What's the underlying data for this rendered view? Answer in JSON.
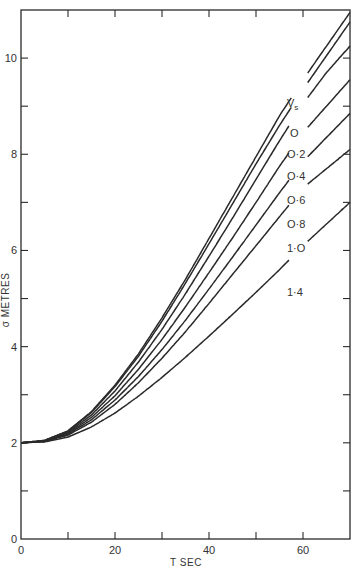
{
  "chart_data": {
    "type": "line",
    "title": "",
    "xlabel": "T SEC",
    "ylabel": "σ METRES",
    "xlim": [
      0,
      70
    ],
    "ylim": [
      0,
      11
    ],
    "x_ticks": [
      0,
      10,
      20,
      30,
      40,
      50,
      60
    ],
    "x_tick_labels": [
      "0",
      "20",
      "40",
      "60"
    ],
    "x_tick_label_values": [
      0,
      20,
      40,
      60
    ],
    "y_ticks": [
      0,
      1,
      2,
      3,
      4,
      5,
      6,
      7,
      8,
      9,
      10
    ],
    "y_tick_labels": [
      "0",
      "2",
      "4",
      "6",
      "8",
      "10"
    ],
    "y_tick_label_values": [
      0,
      2,
      4,
      6,
      8,
      10
    ],
    "grid": false,
    "legend_title": "Vs",
    "legend_position": "inline-right",
    "x": [
      0,
      5,
      10,
      15,
      20,
      25,
      30,
      35,
      40,
      45,
      50,
      55,
      60,
      65,
      70
    ],
    "series": [
      {
        "name": "0",
        "label": "O",
        "values": [
          2.0,
          2.05,
          2.25,
          2.65,
          3.2,
          3.85,
          4.6,
          5.4,
          6.25,
          7.1,
          7.95,
          8.8,
          9.55,
          10.25,
          10.95
        ]
      },
      {
        "name": "0.2",
        "label": "O·2",
        "values": [
          2.0,
          2.05,
          2.24,
          2.63,
          3.17,
          3.8,
          4.53,
          5.32,
          6.14,
          6.97,
          7.8,
          8.6,
          9.35,
          10.05,
          10.75
        ]
      },
      {
        "name": "0.4",
        "label": "O·4",
        "values": [
          2.0,
          2.04,
          2.22,
          2.58,
          3.08,
          3.68,
          4.36,
          5.1,
          5.88,
          6.67,
          7.48,
          8.28,
          9.05,
          9.7,
          10.25
        ]
      },
      {
        "name": "0.6",
        "label": "O·6",
        "values": [
          2.0,
          2.04,
          2.2,
          2.53,
          2.98,
          3.53,
          4.15,
          4.83,
          5.54,
          6.26,
          7.0,
          7.75,
          8.45,
          9.0,
          9.55
        ]
      },
      {
        "name": "0.8",
        "label": "O·8",
        "values": [
          2.0,
          2.03,
          2.18,
          2.48,
          2.89,
          3.38,
          3.94,
          4.55,
          5.2,
          5.86,
          6.53,
          7.2,
          7.85,
          8.35,
          8.85
        ]
      },
      {
        "name": "1.0",
        "label": "1·O",
        "values": [
          2.0,
          2.03,
          2.16,
          2.43,
          2.8,
          3.25,
          3.76,
          4.31,
          4.9,
          5.5,
          6.1,
          6.7,
          7.3,
          7.7,
          8.1
        ]
      },
      {
        "name": "1.4",
        "label": "1·4",
        "values": [
          2.0,
          2.02,
          2.12,
          2.33,
          2.62,
          2.97,
          3.36,
          3.78,
          4.22,
          4.67,
          5.13,
          5.6,
          6.1,
          6.55,
          7.0
        ]
      }
    ],
    "gap_in_curves_for_labels": true
  },
  "labels": {
    "origin_y": "0",
    "origin_x": "0"
  }
}
